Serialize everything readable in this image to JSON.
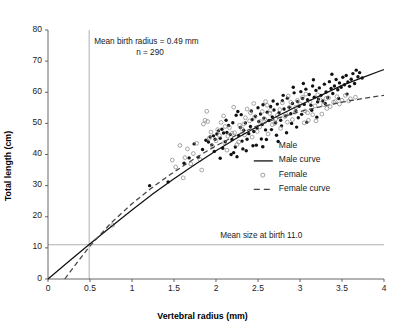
{
  "chart_data": {
    "type": "scatter",
    "title": "",
    "xlabel": "Vertebral radius (mm)",
    "ylabel": "Total length (cm)",
    "xlim": [
      0,
      4
    ],
    "ylim": [
      0,
      80
    ],
    "xticks": [
      "0",
      "0.5",
      "1",
      "1.5",
      "2",
      "2.5",
      "3",
      "3.5",
      "4"
    ],
    "xtick_values": [
      0,
      0.5,
      1,
      1.5,
      2,
      2.5,
      3,
      3.5,
      4
    ],
    "yticks": [
      "0",
      "10",
      "20",
      "30",
      "40",
      "50",
      "60",
      "70",
      "80"
    ],
    "ytick_values": [
      0,
      10,
      20,
      30,
      40,
      50,
      60,
      70,
      80
    ],
    "grid": false,
    "legend_position": "center-right",
    "legend": [
      {
        "label": "Male",
        "marker": "filled-dot",
        "color": "#111111"
      },
      {
        "label": "Male curve",
        "marker": "solid-line",
        "color": "#111111"
      },
      {
        "label": "Female",
        "marker": "open-circle",
        "color": "#8a8a8a"
      },
      {
        "label": "Female curve",
        "marker": "dashed-line",
        "color": "#444444"
      }
    ],
    "annotations": [
      {
        "name": "mean-birth-radius",
        "text": "Mean birth radius = 0.49 mm",
        "x": 0.55,
        "y": 76.5
      },
      {
        "name": "sample-size",
        "text": "n = 290",
        "x": 1.05,
        "y": 72.8
      },
      {
        "name": "mean-size-at-birth",
        "text": "Mean size at birth 11.0",
        "x": 2.05,
        "y": 14.2
      }
    ],
    "reference_lines": [
      {
        "name": "mean-birth-radius-line",
        "orientation": "vertical",
        "value": 0.49,
        "style": "solid",
        "color": "#9a9a9a"
      },
      {
        "name": "mean-size-at-birth-line",
        "orientation": "horizontal",
        "value": 11.0,
        "style": "solid",
        "color": "#9a9a9a"
      }
    ],
    "series": [
      {
        "name": "Male",
        "marker": "filled-dot",
        "color": "#111111",
        "points": [
          [
            1.21,
            30.0
          ],
          [
            1.43,
            31.2
          ],
          [
            1.62,
            37.2
          ],
          [
            1.68,
            38.9
          ],
          [
            1.74,
            43.4
          ],
          [
            1.79,
            39.1
          ],
          [
            1.84,
            41.6
          ],
          [
            1.88,
            44.6
          ],
          [
            1.91,
            44.0
          ],
          [
            1.93,
            45.6
          ],
          [
            1.95,
            43.1
          ],
          [
            1.97,
            46.0
          ],
          [
            1.99,
            44.9
          ],
          [
            2.01,
            46.6
          ],
          [
            2.03,
            47.6
          ],
          [
            2.05,
            45.2
          ],
          [
            2.07,
            48.1
          ],
          [
            2.09,
            46.9
          ],
          [
            2.11,
            44.1
          ],
          [
            2.13,
            47.1
          ],
          [
            2.15,
            49.3
          ],
          [
            2.17,
            46.4
          ],
          [
            2.19,
            44.8
          ],
          [
            2.21,
            40.6
          ],
          [
            2.23,
            42.4
          ],
          [
            2.25,
            39.3
          ],
          [
            2.27,
            46.1
          ],
          [
            2.29,
            48.7
          ],
          [
            2.31,
            44.3
          ],
          [
            2.33,
            47.8
          ],
          [
            2.35,
            50.1
          ],
          [
            2.37,
            44.9
          ],
          [
            2.39,
            46.7
          ],
          [
            2.41,
            49.0
          ],
          [
            2.43,
            51.2
          ],
          [
            2.45,
            47.4
          ],
          [
            2.47,
            52.3
          ],
          [
            2.49,
            48.4
          ],
          [
            2.51,
            50.6
          ],
          [
            2.53,
            53.0
          ],
          [
            2.55,
            49.6
          ],
          [
            2.57,
            51.7
          ],
          [
            2.59,
            47.9
          ],
          [
            2.61,
            53.6
          ],
          [
            2.63,
            50.9
          ],
          [
            2.65,
            55.4
          ],
          [
            2.67,
            52.1
          ],
          [
            2.69,
            54.3
          ],
          [
            2.71,
            50.2
          ],
          [
            2.73,
            56.2
          ],
          [
            2.75,
            53.4
          ],
          [
            2.77,
            51.0
          ],
          [
            2.79,
            57.3
          ],
          [
            2.81,
            54.6
          ],
          [
            2.83,
            52.4
          ],
          [
            2.85,
            58.1
          ],
          [
            2.87,
            55.2
          ],
          [
            2.89,
            53.1
          ],
          [
            2.91,
            56.4
          ],
          [
            2.93,
            59.8
          ],
          [
            2.95,
            54.1
          ],
          [
            2.97,
            57.0
          ],
          [
            2.99,
            55.5
          ],
          [
            3.01,
            60.2
          ],
          [
            3.03,
            58.0
          ],
          [
            3.05,
            56.1
          ],
          [
            3.07,
            61.0
          ],
          [
            3.09,
            57.6
          ],
          [
            3.11,
            59.3
          ],
          [
            3.13,
            55.8
          ],
          [
            3.15,
            62.0
          ],
          [
            3.17,
            58.4
          ],
          [
            3.19,
            60.6
          ],
          [
            3.21,
            56.9
          ],
          [
            3.23,
            61.4
          ],
          [
            3.25,
            59.0
          ],
          [
            3.27,
            57.2
          ],
          [
            3.29,
            62.6
          ],
          [
            3.31,
            60.1
          ],
          [
            3.33,
            58.3
          ],
          [
            3.35,
            63.4
          ],
          [
            3.37,
            61.2
          ],
          [
            3.39,
            59.6
          ],
          [
            3.41,
            62.0
          ],
          [
            3.43,
            64.1
          ],
          [
            3.45,
            60.8
          ],
          [
            3.47,
            63.0
          ],
          [
            3.49,
            61.6
          ],
          [
            3.51,
            64.8
          ],
          [
            3.53,
            62.4
          ],
          [
            3.55,
            65.4
          ],
          [
            3.57,
            63.3
          ],
          [
            3.59,
            61.9
          ],
          [
            3.61,
            64.2
          ],
          [
            3.63,
            66.0
          ],
          [
            3.65,
            62.8
          ],
          [
            3.67,
            67.1
          ],
          [
            3.69,
            65.0
          ],
          [
            3.71,
            66.3
          ],
          [
            3.74,
            64.6
          ],
          [
            2.12,
            51.0
          ],
          [
            2.24,
            52.6
          ],
          [
            2.36,
            41.2
          ],
          [
            2.48,
            43.0
          ],
          [
            2.6,
            44.8
          ],
          [
            2.72,
            46.2
          ],
          [
            2.84,
            47.0
          ],
          [
            2.96,
            48.8
          ],
          [
            3.08,
            50.4
          ],
          [
            3.2,
            52.0
          ],
          [
            2.05,
            38.8
          ],
          [
            2.18,
            40.0
          ],
          [
            2.3,
            52.8
          ],
          [
            2.42,
            54.0
          ],
          [
            2.54,
            45.0
          ],
          [
            2.66,
            48.0
          ],
          [
            2.78,
            49.2
          ],
          [
            2.9,
            50.0
          ],
          [
            3.02,
            52.9
          ],
          [
            3.14,
            54.2
          ],
          [
            2.08,
            42.0
          ],
          [
            2.2,
            50.2
          ],
          [
            2.32,
            41.8
          ],
          [
            2.44,
            42.8
          ],
          [
            2.56,
            56.0
          ],
          [
            2.68,
            57.2
          ],
          [
            2.8,
            59.0
          ],
          [
            2.92,
            61.6
          ],
          [
            3.04,
            62.8
          ],
          [
            3.16,
            64.0
          ],
          [
            1.98,
            41.0
          ],
          [
            2.26,
            53.8
          ],
          [
            2.5,
            55.0
          ],
          [
            2.74,
            44.2
          ],
          [
            2.98,
            51.8
          ],
          [
            3.22,
            57.8
          ],
          [
            3.3,
            56.4
          ],
          [
            3.38,
            65.8
          ],
          [
            3.46,
            58.0
          ],
          [
            3.56,
            59.4
          ]
        ]
      },
      {
        "name": "Female",
        "marker": "open-circle",
        "color": "#8a8a8a",
        "points": [
          [
            0.77,
            17.3
          ],
          [
            1.48,
            38.2
          ],
          [
            1.52,
            36.0
          ],
          [
            1.57,
            42.9
          ],
          [
            1.61,
            32.5
          ],
          [
            1.63,
            39.0
          ],
          [
            1.66,
            41.8
          ],
          [
            1.7,
            37.0
          ],
          [
            1.73,
            40.3
          ],
          [
            1.77,
            43.6
          ],
          [
            1.81,
            38.4
          ],
          [
            1.85,
            49.8
          ],
          [
            1.87,
            51.0
          ],
          [
            1.89,
            53.9
          ],
          [
            1.92,
            45.3
          ],
          [
            1.94,
            47.2
          ],
          [
            1.96,
            42.6
          ],
          [
            2.0,
            44.4
          ],
          [
            2.02,
            48.0
          ],
          [
            2.04,
            46.1
          ],
          [
            2.06,
            50.3
          ],
          [
            2.1,
            43.8
          ],
          [
            2.14,
            45.9
          ],
          [
            2.16,
            48.6
          ],
          [
            2.22,
            47.0
          ],
          [
            2.28,
            49.4
          ],
          [
            2.34,
            46.3
          ],
          [
            2.4,
            50.8
          ],
          [
            2.46,
            52.0
          ],
          [
            2.52,
            48.9
          ],
          [
            2.58,
            51.4
          ],
          [
            2.64,
            53.2
          ],
          [
            2.7,
            50.0
          ],
          [
            2.76,
            54.4
          ],
          [
            2.82,
            52.2
          ],
          [
            2.88,
            55.0
          ],
          [
            2.94,
            53.6
          ],
          [
            3.0,
            56.2
          ],
          [
            3.06,
            54.0
          ],
          [
            3.12,
            57.0
          ],
          [
            3.18,
            55.6
          ],
          [
            3.24,
            57.6
          ],
          [
            3.28,
            56.0
          ],
          [
            3.34,
            58.2
          ],
          [
            3.4,
            56.8
          ],
          [
            3.44,
            58.6
          ],
          [
            3.5,
            57.4
          ],
          [
            3.54,
            59.0
          ],
          [
            3.6,
            57.9
          ],
          [
            3.66,
            58.4
          ],
          [
            2.09,
            52.4
          ],
          [
            2.19,
            46.8
          ],
          [
            2.31,
            48.2
          ],
          [
            2.43,
            45.6
          ],
          [
            2.55,
            53.8
          ],
          [
            2.67,
            49.6
          ],
          [
            2.79,
            56.6
          ],
          [
            2.91,
            51.2
          ],
          [
            3.03,
            58.4
          ],
          [
            3.15,
            52.8
          ],
          [
            2.13,
            41.4
          ],
          [
            2.25,
            43.2
          ],
          [
            2.37,
            54.6
          ],
          [
            2.49,
            47.4
          ],
          [
            2.61,
            55.8
          ],
          [
            2.73,
            52.6
          ],
          [
            2.85,
            50.4
          ],
          [
            2.97,
            57.4
          ],
          [
            3.09,
            53.4
          ],
          [
            3.21,
            59.2
          ],
          [
            1.9,
            50.6
          ],
          [
            2.35,
            51.8
          ],
          [
            2.62,
            46.6
          ],
          [
            2.86,
            58.8
          ],
          [
            3.1,
            51.0
          ],
          [
            3.32,
            54.8
          ],
          [
            3.42,
            57.0
          ],
          [
            2.45,
            56.4
          ],
          [
            2.95,
            55.2
          ],
          [
            3.26,
            53.0
          ],
          [
            1.83,
            35.0
          ],
          [
            2.11,
            49.0
          ],
          [
            2.27,
            44.0
          ],
          [
            2.41,
            53.4
          ],
          [
            2.53,
            50.6
          ],
          [
            2.65,
            54.2
          ],
          [
            2.77,
            48.4
          ],
          [
            2.89,
            56.8
          ],
          [
            3.05,
            50.2
          ],
          [
            3.36,
            55.4
          ],
          [
            2.21,
            55.2
          ],
          [
            2.33,
            49.8
          ],
          [
            2.59,
            57.0
          ],
          [
            2.71,
            51.4
          ],
          [
            2.83,
            53.0
          ],
          [
            3.07,
            59.4
          ],
          [
            3.19,
            50.8
          ],
          [
            3.31,
            58.0
          ],
          [
            3.47,
            56.2
          ],
          [
            3.58,
            57.2
          ]
        ]
      }
    ],
    "curves": [
      {
        "name": "Male curve",
        "style": "solid",
        "color": "#111111",
        "points": [
          [
            0.0,
            0.0
          ],
          [
            0.25,
            5.7
          ],
          [
            0.49,
            11.1
          ],
          [
            0.75,
            16.8
          ],
          [
            1.0,
            22.2
          ],
          [
            1.25,
            27.4
          ],
          [
            1.5,
            32.2
          ],
          [
            1.75,
            36.8
          ],
          [
            2.0,
            41.2
          ],
          [
            2.25,
            45.3
          ],
          [
            2.5,
            49.1
          ],
          [
            2.75,
            52.6
          ],
          [
            3.0,
            55.9
          ],
          [
            3.25,
            59.0
          ],
          [
            3.5,
            62.2
          ],
          [
            3.75,
            64.8
          ],
          [
            4.0,
            67.3
          ]
        ]
      },
      {
        "name": "Female curve",
        "style": "dashed",
        "color": "#444444",
        "points": [
          [
            0.2,
            0.0
          ],
          [
            0.35,
            5.4
          ],
          [
            0.49,
            10.3
          ],
          [
            0.75,
            18.0
          ],
          [
            1.0,
            24.2
          ],
          [
            1.25,
            29.6
          ],
          [
            1.5,
            34.4
          ],
          [
            1.75,
            38.8
          ],
          [
            2.0,
            42.8
          ],
          [
            2.25,
            46.3
          ],
          [
            2.5,
            49.3
          ],
          [
            2.75,
            51.8
          ],
          [
            3.0,
            53.8
          ],
          [
            3.25,
            55.4
          ],
          [
            3.5,
            56.8
          ],
          [
            3.75,
            58.0
          ],
          [
            4.0,
            59.0
          ]
        ]
      }
    ]
  }
}
